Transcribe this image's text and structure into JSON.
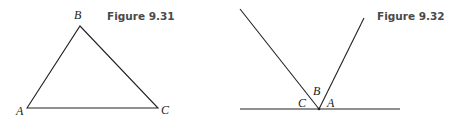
{
  "figures": [
    {
      "caption": "Figure 9.31",
      "type": "triangle",
      "vertices": {
        "A": "A",
        "B": "B",
        "C": "C"
      }
    },
    {
      "caption": "Figure 9.32",
      "type": "angles-on-a-line",
      "angle_labels": {
        "C": "C",
        "B": "B",
        "A": "A"
      }
    }
  ]
}
